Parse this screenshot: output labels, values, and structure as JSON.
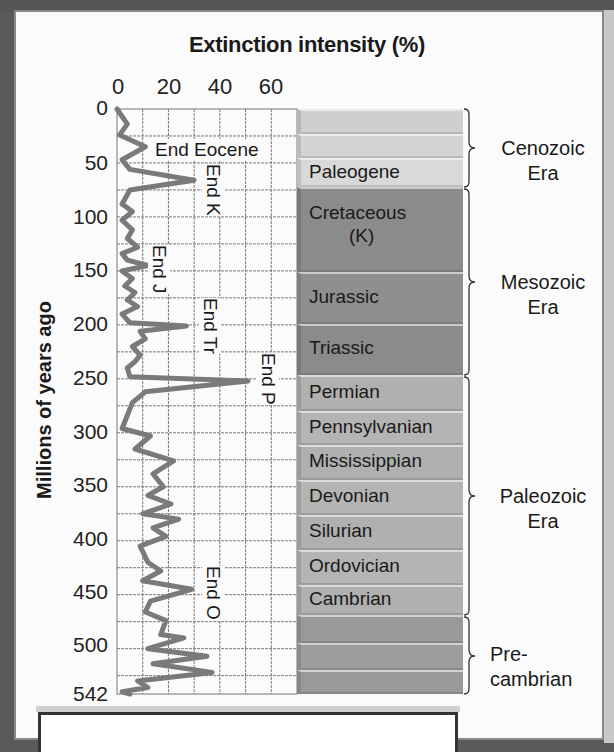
{
  "chart_data": {
    "type": "line",
    "title": "Extinction intensity (%)",
    "xlabel": "Extinction intensity (%)",
    "ylabel": "Millions of years ago",
    "x_axis_position": "top",
    "xlim": [
      0,
      70
    ],
    "ylim": [
      0,
      542
    ],
    "y_inverted": true,
    "x_ticks": [
      0,
      20,
      40,
      60
    ],
    "y_ticks": [
      0,
      50,
      100,
      150,
      200,
      250,
      300,
      350,
      400,
      450,
      500,
      542
    ],
    "grid": true,
    "grid_x_step": 10,
    "grid_y_step": 25,
    "series": [
      {
        "name": "Extinction intensity",
        "color": "#7a7a7a",
        "points": [
          {
            "mya": 0,
            "pct": 0
          },
          {
            "mya": 14,
            "pct": 4
          },
          {
            "mya": 24,
            "pct": 1
          },
          {
            "mya": 35,
            "pct": 11
          },
          {
            "mya": 47,
            "pct": 2
          },
          {
            "mya": 56,
            "pct": 5
          },
          {
            "mya": 66,
            "pct": 30
          },
          {
            "mya": 75,
            "pct": 5
          },
          {
            "mya": 88,
            "pct": 2
          },
          {
            "mya": 95,
            "pct": 6
          },
          {
            "mya": 103,
            "pct": 2
          },
          {
            "mya": 112,
            "pct": 6
          },
          {
            "mya": 120,
            "pct": 4
          },
          {
            "mya": 128,
            "pct": 8
          },
          {
            "mya": 134,
            "pct": 2
          },
          {
            "mya": 140,
            "pct": 4
          },
          {
            "mya": 145,
            "pct": 12
          },
          {
            "mya": 150,
            "pct": 2
          },
          {
            "mya": 157,
            "pct": 6
          },
          {
            "mya": 164,
            "pct": 3
          },
          {
            "mya": 170,
            "pct": 7
          },
          {
            "mya": 177,
            "pct": 4
          },
          {
            "mya": 183,
            "pct": 8
          },
          {
            "mya": 190,
            "pct": 2
          },
          {
            "mya": 198,
            "pct": 5
          },
          {
            "mya": 201,
            "pct": 27
          },
          {
            "mya": 206,
            "pct": 9
          },
          {
            "mya": 213,
            "pct": 11
          },
          {
            "mya": 220,
            "pct": 6
          },
          {
            "mya": 228,
            "pct": 9
          },
          {
            "mya": 234,
            "pct": 7
          },
          {
            "mya": 240,
            "pct": 4
          },
          {
            "mya": 248,
            "pct": 5
          },
          {
            "mya": 252,
            "pct": 51
          },
          {
            "mya": 262,
            "pct": 11
          },
          {
            "mya": 272,
            "pct": 6
          },
          {
            "mya": 290,
            "pct": 3
          },
          {
            "mya": 296,
            "pct": 2
          },
          {
            "mya": 303,
            "pct": 13
          },
          {
            "mya": 315,
            "pct": 7
          },
          {
            "mya": 326,
            "pct": 22
          },
          {
            "mya": 338,
            "pct": 14
          },
          {
            "mya": 350,
            "pct": 18
          },
          {
            "mya": 358,
            "pct": 12
          },
          {
            "mya": 366,
            "pct": 21
          },
          {
            "mya": 375,
            "pct": 10
          },
          {
            "mya": 380,
            "pct": 24
          },
          {
            "mya": 388,
            "pct": 14
          },
          {
            "mya": 396,
            "pct": 19
          },
          {
            "mya": 405,
            "pct": 9
          },
          {
            "mya": 420,
            "pct": 12
          },
          {
            "mya": 428,
            "pct": 17
          },
          {
            "mya": 437,
            "pct": 10
          },
          {
            "mya": 445,
            "pct": 29
          },
          {
            "mya": 456,
            "pct": 13
          },
          {
            "mya": 466,
            "pct": 11
          },
          {
            "mya": 474,
            "pct": 19
          },
          {
            "mya": 487,
            "pct": 17
          },
          {
            "mya": 490,
            "pct": 26
          },
          {
            "mya": 500,
            "pct": 12
          },
          {
            "mya": 507,
            "pct": 35
          },
          {
            "mya": 514,
            "pct": 14
          },
          {
            "mya": 522,
            "pct": 37
          },
          {
            "mya": 530,
            "pct": 8
          },
          {
            "mya": 536,
            "pct": 12
          },
          {
            "mya": 540,
            "pct": 2
          },
          {
            "mya": 542,
            "pct": 5
          }
        ]
      }
    ],
    "annotations": [
      {
        "text": "End Eocene",
        "mya": 35,
        "pct": 11,
        "orientation": "horizontal"
      },
      {
        "text": "End K",
        "mya": 66,
        "pct": 30,
        "orientation": "vertical"
      },
      {
        "text": "End J",
        "mya": 145,
        "pct": 12,
        "orientation": "vertical"
      },
      {
        "text": "End Tr",
        "mya": 201,
        "pct": 27,
        "orientation": "vertical"
      },
      {
        "text": "End P",
        "mya": 252,
        "pct": 51,
        "orientation": "vertical"
      },
      {
        "text": "End O",
        "mya": 445,
        "pct": 29,
        "orientation": "vertical"
      }
    ],
    "periods": [
      {
        "label": "",
        "start": 0,
        "end": 23,
        "era": "Cenozoic",
        "color": "#cfcfcf"
      },
      {
        "label": "",
        "start": 23,
        "end": 45,
        "era": "Cenozoic",
        "color": "#d3d3d3"
      },
      {
        "label": "Paleogene",
        "start": 45,
        "end": 66,
        "era": "Cenozoic",
        "color": "#d8d8d8"
      },
      {
        "label": "Cretaceous (K)",
        "start": 66,
        "end": 145,
        "era": "Mesozoic",
        "color": "#8c8c8c"
      },
      {
        "label": "Jurassic",
        "start": 145,
        "end": 201,
        "era": "Mesozoic",
        "color": "#8f8f8f"
      },
      {
        "label": "Triassic",
        "start": 201,
        "end": 252,
        "era": "Mesozoic",
        "color": "#8c8c8c"
      },
      {
        "label": "Permian",
        "start": 252,
        "end": 299,
        "era": "Paleozoic",
        "color": "#b0b0b0"
      },
      {
        "label": "Pennsylvanian",
        "start": 299,
        "end": 323,
        "era": "Paleozoic",
        "color": "#b3b3b3"
      },
      {
        "label": "Mississippian",
        "start": 323,
        "end": 359,
        "era": "Paleozoic",
        "color": "#b0b0b0"
      },
      {
        "label": "Devonian",
        "start": 359,
        "end": 383,
        "era": "Paleozoic",
        "color": "#b3b3b3"
      },
      {
        "label": "Silurian",
        "start": 383,
        "end": 419,
        "era": "Paleozoic",
        "color": "#b0b0b0"
      },
      {
        "label": "Ordovician",
        "start": 419,
        "end": 444,
        "era": "Paleozoic",
        "color": "#b3b3b3"
      },
      {
        "label": "Cambrian",
        "start": 444,
        "end": 485,
        "era": "Paleozoic",
        "color": "#b0b0b0"
      },
      {
        "label": "",
        "start": 485,
        "end": 505,
        "era": "Precambrian",
        "color": "#9a9a9a"
      },
      {
        "label": "",
        "start": 505,
        "end": 525,
        "era": "Precambrian",
        "color": "#9d9d9d"
      },
      {
        "label": "",
        "start": 525,
        "end": 542,
        "era": "Precambrian",
        "color": "#9a9a9a"
      }
    ],
    "eras": [
      {
        "label": "Cenozoic Era",
        "line1": "Cenozoic",
        "line2": "Era",
        "start": 0,
        "end": 66
      },
      {
        "label": "Mesozoic Era",
        "line1": "Mesozoic",
        "line2": "Era",
        "start": 66,
        "end": 252
      },
      {
        "label": "Paleozoic Era",
        "line1": "Paleozoic",
        "line2": "Era",
        "start": 252,
        "end": 485
      },
      {
        "label": "Pre-cambrian",
        "line1": "Pre-",
        "line2": "cambrian",
        "start": 485,
        "end": 542
      }
    ]
  },
  "labels": {
    "title": "Extinction intensity (%)",
    "ylabel": "Millions of years ago",
    "x_ticks": [
      "0",
      "20",
      "40",
      "60"
    ],
    "y_ticks": [
      "0",
      "50",
      "100",
      "150",
      "200",
      "250",
      "300",
      "350",
      "400",
      "450",
      "500",
      "542"
    ],
    "events": {
      "eocene": "End Eocene",
      "k": "End K",
      "j": "End J",
      "tr": "End Tr",
      "p": "End P",
      "o": "End O"
    },
    "periods": {
      "paleogene": "Paleogene",
      "cretaceous": "Cretaceous",
      "cretaceous_abbr": "(K)",
      "jurassic": "Jurassic",
      "triassic": "Triassic",
      "permian": "Permian",
      "pennsylvanian": "Pennsylvanian",
      "mississippian": "Mississippian",
      "devonian": "Devonian",
      "silurian": "Silurian",
      "ordovician": "Ordovician",
      "cambrian": "Cambrian"
    },
    "eras": {
      "cenozoic_1": "Cenozoic",
      "cenozoic_2": "Era",
      "mesozoic_1": "Mesozoic",
      "mesozoic_2": "Era",
      "paleozoic_1": "Paleozoic",
      "paleozoic_2": "Era",
      "precambrian_1": "Pre-",
      "precambrian_2": "cambrian"
    }
  },
  "colors": {
    "line": "#7a7a7a",
    "grid": "#777777",
    "cenozoic_band": "#d5d5d5",
    "mesozoic_band": "#8c8c8c",
    "paleozoic_band": "#b1b1b1",
    "precambrian_band": "#9b9b9b"
  }
}
